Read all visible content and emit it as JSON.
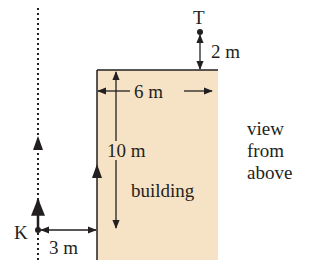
{
  "diagram": {
    "labels": {
      "target": "T",
      "observer": "K",
      "distance_T_above": "2 m",
      "building_width": "6 m",
      "building_length": "10 m",
      "distance_K_to_building": "3 m",
      "building": "building",
      "view_line1": "view",
      "view_line2": "from",
      "view_line3": "above"
    },
    "colors": {
      "building_fill": "#f6e3c6",
      "line": "#231f20",
      "background": "#ffffff"
    }
  }
}
